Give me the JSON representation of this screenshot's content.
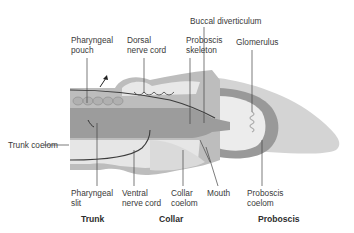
{
  "diagram": {
    "colors": {
      "body_outer": "#b9b9b9",
      "wall_dark": "#8f8f8f",
      "coelom_light": "#e6e6e6",
      "proboscis_tip": "#d2d2d2",
      "nerve_line": "#3c3c3c"
    },
    "labels": {
      "pharyngeal_pouch": "Pharyngeal\npouch",
      "dorsal_nerve_cord": "Dorsal\nnerve cord",
      "buccal_diverticulum": "Buccal diverticulum",
      "proboscis_skeleton": "Proboscis\nskeleton",
      "glomerulus": "Glomerulus",
      "trunk_coelom": "Trunk coelom",
      "pharyngeal_slit": "Pharyngeal\nslit",
      "ventral_nerve_cord": "Ventral\nnerve cord",
      "collar_coelom": "Collar\ncoelom",
      "mouth": "Mouth",
      "proboscis_coelom": "Proboscis\ncoelom"
    },
    "regions": {
      "trunk": "Trunk",
      "collar": "Collar",
      "proboscis": "Proboscis"
    }
  }
}
